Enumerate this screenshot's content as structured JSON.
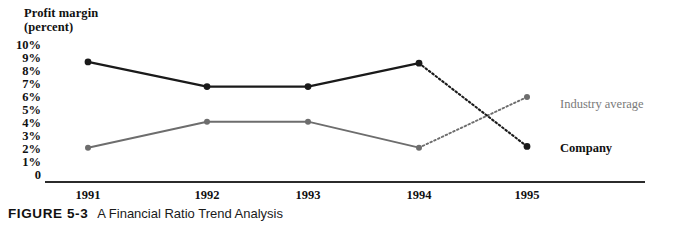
{
  "figure": {
    "label": "FIGURE 5-3",
    "title": "A Financial Ratio Trend Analysis"
  },
  "chart_data": {
    "type": "line",
    "title": "A Financial Ratio Trend Analysis",
    "axis_title": "Profit margin\n(percent)",
    "xlabel": "",
    "ylabel": "Profit margin (percent)",
    "categories": [
      "1991",
      "1992",
      "1993",
      "1994",
      "1995"
    ],
    "x_tick_labels": [
      "1991",
      "1992",
      "1993",
      "1994",
      "1995"
    ],
    "y_tick_labels": [
      "10%",
      "9%",
      "8%",
      "7%",
      "6%",
      "5%",
      "4%",
      "3%",
      "2%",
      "1%",
      "0"
    ],
    "y_tick_values": [
      10,
      9,
      8,
      7,
      6,
      5,
      4,
      3,
      2,
      1,
      0
    ],
    "ylim": [
      0,
      10
    ],
    "grid": false,
    "legend_position": "right-inline",
    "series": [
      {
        "name": "Company",
        "color": "#1a1a1a",
        "values": [
          8.7,
          6.8,
          6.8,
          8.6,
          2.2
        ],
        "projected_from": "1994",
        "projected_style": "dotted"
      },
      {
        "name": "Industry average",
        "color": "#6d6d6d",
        "values": [
          2.1,
          4.1,
          4.1,
          2.1,
          6.0
        ],
        "projected_from": "1994",
        "projected_style": "dotted"
      }
    ]
  }
}
